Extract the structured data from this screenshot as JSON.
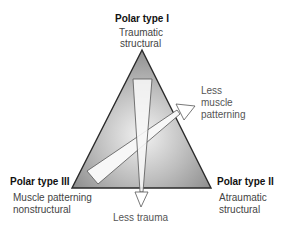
{
  "diagram": {
    "poles": [
      {
        "id": "I",
        "title": "Polar type I",
        "line1": "Traumatic",
        "line2": "structural"
      },
      {
        "id": "II",
        "title": "Polar type II",
        "line1": "Atraumatic",
        "line2": "structural"
      },
      {
        "id": "III",
        "title": "Polar type III",
        "line1": "Muscle patterning",
        "line2": "nonstructural"
      }
    ],
    "arrows": [
      {
        "id": "vertical",
        "label": "Less trauma"
      },
      {
        "id": "diagonal",
        "line1": "Less",
        "line2": "muscle",
        "line3": "patterning"
      }
    ],
    "colors": {
      "triangle_outer": "#8f8f8f",
      "triangle_inner": "#f2f2f2",
      "outline": "#2a2a2a",
      "arrow_fill": "#f7f7f7",
      "arrow_stroke": "#555555"
    }
  }
}
